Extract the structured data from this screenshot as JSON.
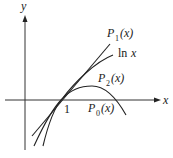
{
  "diagram": {
    "axes": {
      "x_label": "x",
      "y_label": "y",
      "tick_label": "1"
    },
    "curves": [
      {
        "name": "P_1(x)",
        "label_main": "P",
        "label_sub": "1",
        "label_arg": "(x)",
        "description": "tangent line to ln x at x=1"
      },
      {
        "name": "ln x",
        "label_main": "ln",
        "label_arg": "x",
        "description": "natural logarithm"
      },
      {
        "name": "P_2(x)",
        "label_main": "P",
        "label_sub": "2",
        "label_arg": "(x)",
        "description": "quadratic Taylor polynomial"
      },
      {
        "name": "P_0(x)",
        "label_main": "P",
        "label_sub": "0",
        "label_arg": "(x)",
        "description": "label near x-axis"
      }
    ],
    "colors": {
      "stroke": "#222222",
      "background": "#ffffff"
    }
  }
}
